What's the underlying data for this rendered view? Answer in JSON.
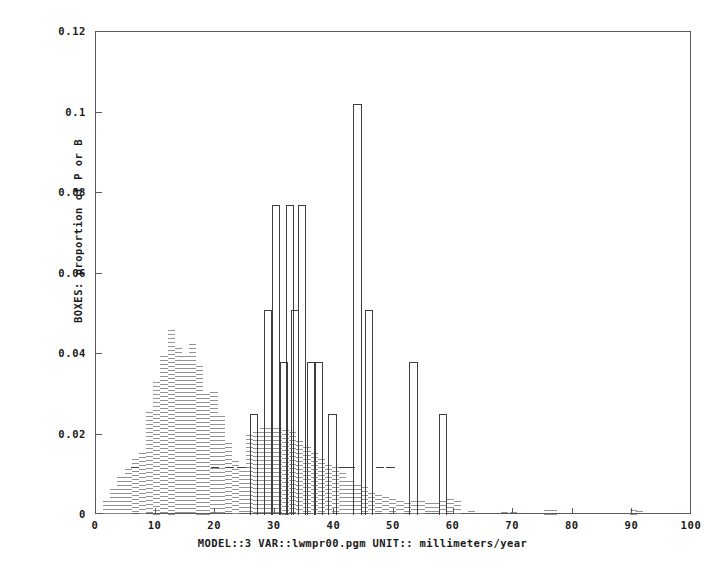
{
  "chart_data": {
    "type": "bar",
    "title": "",
    "subtitle": "",
    "xlabel": "MODEL::3 VAR::lwmpr00.pgm UNIT:: millimeters/year",
    "ylabel": "BOXES: proportion of P or B",
    "xlim": [
      0,
      100
    ],
    "ylim": [
      0,
      0.12
    ],
    "grid": false,
    "legend_position": "none",
    "xticks": [
      0,
      10,
      20,
      30,
      40,
      50,
      60,
      70,
      80,
      90,
      100
    ],
    "xtick_labels": [
      "0",
      "10",
      "20",
      "30",
      "40",
      "50",
      "60",
      "70",
      "80",
      "90",
      "100"
    ],
    "yticks": [
      0,
      0.02,
      0.04,
      0.06,
      0.08,
      0.1,
      0.12
    ],
    "ytick_labels": [
      "0",
      "0.02",
      "0.04",
      "0.06",
      "0.08",
      "0.1",
      "0.12"
    ],
    "series": [
      {
        "name": "BOXES",
        "style": "open-box-histogram",
        "color": "#3f3f42",
        "bin_width": 1.4,
        "bars": [
          {
            "x": 6.5,
            "value": 0.012
          },
          {
            "x": 20.0,
            "value": 0.012
          },
          {
            "x": 22.4,
            "value": 0.012
          },
          {
            "x": 24.4,
            "value": 0.012
          },
          {
            "x": 26.5,
            "value": 0.025
          },
          {
            "x": 28.9,
            "value": 0.051
          },
          {
            "x": 30.2,
            "value": 0.077
          },
          {
            "x": 31.5,
            "value": 0.038
          },
          {
            "x": 32.5,
            "value": 0.077
          },
          {
            "x": 33.4,
            "value": 0.051
          },
          {
            "x": 34.6,
            "value": 0.077
          },
          {
            "x": 36.1,
            "value": 0.038
          },
          {
            "x": 37.4,
            "value": 0.038
          },
          {
            "x": 39.7,
            "value": 0.025
          },
          {
            "x": 41.4,
            "value": 0.012
          },
          {
            "x": 42.8,
            "value": 0.012
          },
          {
            "x": 43.9,
            "value": 0.102
          },
          {
            "x": 45.8,
            "value": 0.051
          },
          {
            "x": 47.6,
            "value": 0.012
          },
          {
            "x": 49.4,
            "value": 0.012
          },
          {
            "x": 53.3,
            "value": 0.038
          },
          {
            "x": 58.2,
            "value": 0.025
          }
        ]
      },
      {
        "name": "POINTS",
        "style": "dotted-profile",
        "color": "#8d8d90",
        "bin_width": 1.2,
        "bars": [
          {
            "x": 1.8,
            "value": 0.0035
          },
          {
            "x": 3.0,
            "value": 0.0065
          },
          {
            "x": 4.2,
            "value": 0.0095
          },
          {
            "x": 5.4,
            "value": 0.0115
          },
          {
            "x": 6.6,
            "value": 0.014
          },
          {
            "x": 7.8,
            "value": 0.0155
          },
          {
            "x": 9.0,
            "value": 0.0255
          },
          {
            "x": 10.2,
            "value": 0.033
          },
          {
            "x": 11.4,
            "value": 0.0395
          },
          {
            "x": 12.6,
            "value": 0.046
          },
          {
            "x": 13.8,
            "value": 0.0415
          },
          {
            "x": 15.0,
            "value": 0.0395
          },
          {
            "x": 16.2,
            "value": 0.0425
          },
          {
            "x": 17.4,
            "value": 0.037
          },
          {
            "x": 18.6,
            "value": 0.03
          },
          {
            "x": 19.8,
            "value": 0.0305
          },
          {
            "x": 21.0,
            "value": 0.0245
          },
          {
            "x": 22.2,
            "value": 0.018
          },
          {
            "x": 23.4,
            "value": 0.0135
          },
          {
            "x": 24.6,
            "value": 0.012
          },
          {
            "x": 25.8,
            "value": 0.02
          },
          {
            "x": 27.0,
            "value": 0.0205
          },
          {
            "x": 28.2,
            "value": 0.0215
          },
          {
            "x": 29.4,
            "value": 0.0215
          },
          {
            "x": 30.6,
            "value": 0.0215
          },
          {
            "x": 31.8,
            "value": 0.021
          },
          {
            "x": 33.0,
            "value": 0.0205
          },
          {
            "x": 34.2,
            "value": 0.0185
          },
          {
            "x": 35.4,
            "value": 0.017
          },
          {
            "x": 36.6,
            "value": 0.0155
          },
          {
            "x": 37.8,
            "value": 0.014
          },
          {
            "x": 39.0,
            "value": 0.0125
          },
          {
            "x": 40.2,
            "value": 0.012
          },
          {
            "x": 41.4,
            "value": 0.0105
          },
          {
            "x": 42.6,
            "value": 0.0085
          },
          {
            "x": 43.8,
            "value": 0.0075
          },
          {
            "x": 45.0,
            "value": 0.007
          },
          {
            "x": 46.2,
            "value": 0.0055
          },
          {
            "x": 47.4,
            "value": 0.005
          },
          {
            "x": 48.6,
            "value": 0.0045
          },
          {
            "x": 49.8,
            "value": 0.004
          },
          {
            "x": 51.0,
            "value": 0.0035
          },
          {
            "x": 52.2,
            "value": 0.003
          },
          {
            "x": 53.4,
            "value": 0.0035
          },
          {
            "x": 54.6,
            "value": 0.0035
          },
          {
            "x": 55.8,
            "value": 0.003
          },
          {
            "x": 57.0,
            "value": 0.003
          },
          {
            "x": 58.2,
            "value": 0.0035
          },
          {
            "x": 59.4,
            "value": 0.004
          },
          {
            "x": 60.6,
            "value": 0.0035
          },
          {
            "x": 63.0,
            "value": 0.001
          },
          {
            "x": 68.5,
            "value": 0.0008
          },
          {
            "x": 70.0,
            "value": 0.0008
          },
          {
            "x": 75.8,
            "value": 0.0012
          },
          {
            "x": 76.8,
            "value": 0.0012
          },
          {
            "x": 90.2,
            "value": 0.0012
          },
          {
            "x": 91.2,
            "value": 0.001
          }
        ]
      }
    ]
  }
}
